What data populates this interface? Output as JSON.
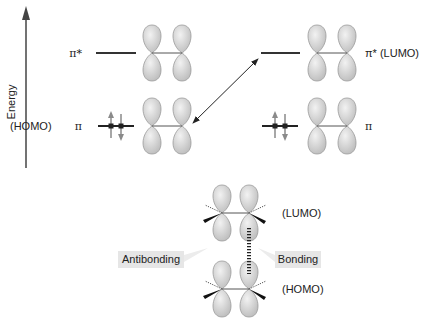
{
  "axis": {
    "label": "Energy"
  },
  "left_molecule": {
    "pi_star_label": "π*",
    "pi_label": "π",
    "homo_label": "(HOMO)",
    "electrons": "2 (paired, ↑↓)"
  },
  "right_molecule": {
    "pi_star_label": "π* (LUMO)",
    "pi_label": "π",
    "electrons": "2 (paired, ↑↓)"
  },
  "interaction_arrow": "double-headed arrow between left HOMO (π) and right LUMO (π*)",
  "bottom": {
    "lumo_label": "(LUMO)",
    "homo_label": "(HOMO)",
    "antibonding_label": "Antibonding",
    "bonding_label": "Bonding"
  },
  "colors": {
    "lobe_fill": "#d4d4d4",
    "lobe_stroke": "#9a9a9a",
    "line": "#333333",
    "callout_bg": "#e6e6e6",
    "arrow_gray": "#8a8a8a"
  }
}
